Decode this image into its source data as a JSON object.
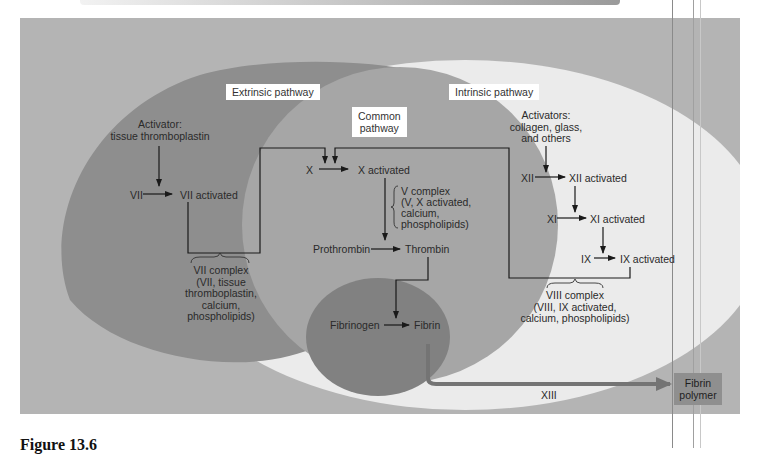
{
  "colors": {
    "background": "#b4b4b4",
    "extrinsic": "#8e8e8e",
    "common": "#a6a6a6",
    "intrinsic": "#ebebeb",
    "fibrin_zone": "#818181",
    "fibrin_polymer_box": "#8f8f8f",
    "xiii_arrow": "#747474",
    "lines": "#1a1a1a"
  },
  "regions": {
    "extrinsic": {
      "title": "Extrinsic pathway"
    },
    "common": {
      "title_line1": "Common",
      "title_line2": "pathway"
    },
    "intrinsic": {
      "title": "Intrinsic pathway"
    }
  },
  "extrinsic": {
    "activator_line1": "Activator:",
    "activator_line2": "tissue thromboplastin",
    "vii": "VII",
    "vii_activated": "VII activated",
    "complex": [
      "VII complex",
      "(VII, tissue",
      "thromboplastin,",
      "calcium,",
      "phospholipids)"
    ]
  },
  "intrinsic": {
    "activators": [
      "Activators:",
      "collagen, glass,",
      "and others"
    ],
    "xii": "XII",
    "xii_activated": "XII activated",
    "xi": "XI",
    "xi_activated": "XI activated",
    "ix": "IX",
    "ix_activated": "IX activated",
    "complex": [
      "VIII complex",
      "(VIII, IX activated,",
      "calcium, phospholipids)"
    ]
  },
  "common": {
    "x": "X",
    "x_activated": "X activated",
    "v_complex": [
      "V complex",
      "(V, X activated,",
      "calcium,",
      "phospholipids)"
    ],
    "prothrombin": "Prothrombin",
    "thrombin": "Thrombin",
    "fibrinogen": "Fibrinogen",
    "fibrin": "Fibrin"
  },
  "final": {
    "xiii": "XIII",
    "fibrin_polymer_line1": "Fibrin",
    "fibrin_polymer_line2": "polymer"
  },
  "caption": "Figure 13.6"
}
